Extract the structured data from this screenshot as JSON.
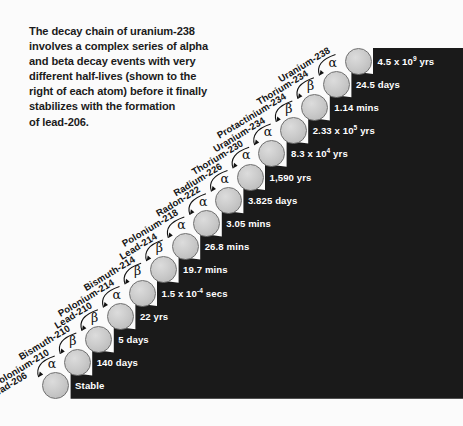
{
  "intro": {
    "text": "The decay chain of uranium-238\ninvolves a complex series of alpha\nand beta decay events with very\ndifferent half-lives (shown to the\nright of each atom) before it finally\nstabilizes with the formation\nof lead-206."
  },
  "colors": {
    "background": "#fbfbfb",
    "panel": "#1a1a1a",
    "atom_fill": "#cacaca",
    "atom_stroke": "#6f6f6f",
    "label_text": "#ffffff",
    "isotope_text": "#141414"
  },
  "chart_data": {
    "type": "diagram",
    "steps": [
      {
        "isotope": "Uranium-238",
        "halflife": "4.5 x 10",
        "exp": "9",
        "unit": " yrs",
        "decay": "α"
      },
      {
        "isotope": "Thorium-234",
        "halflife": "24.5 days",
        "exp": "",
        "unit": "",
        "decay": "β"
      },
      {
        "isotope": "Protactinium-234",
        "halflife": "1.14 mins",
        "exp": "",
        "unit": "",
        "decay": "β"
      },
      {
        "isotope": "Uranium-234",
        "halflife": "2.33 x 10",
        "exp": "5",
        "unit": " yrs",
        "decay": "α"
      },
      {
        "isotope": "Thorium-230",
        "halflife": "8.3 x 10",
        "exp": "4",
        "unit": " yrs",
        "decay": "α"
      },
      {
        "isotope": "Radium-226",
        "halflife": "1,590 yrs",
        "exp": "",
        "unit": "",
        "decay": "α"
      },
      {
        "isotope": "Radon-222",
        "halflife": "3.825 days",
        "exp": "",
        "unit": "",
        "decay": "α"
      },
      {
        "isotope": "Polonium-218",
        "halflife": "3.05 mins",
        "exp": "",
        "unit": "",
        "decay": "α"
      },
      {
        "isotope": "Lead-214",
        "halflife": "26.8 mins",
        "exp": "",
        "unit": "",
        "decay": "β"
      },
      {
        "isotope": "Bismuth-214",
        "halflife": "19.7 mins",
        "exp": "",
        "unit": "",
        "decay": "β"
      },
      {
        "isotope": "Polonium-214",
        "halflife": "1.5 x 10",
        "exp": "-4",
        "unit": " secs",
        "decay": "α"
      },
      {
        "isotope": "Lead-210",
        "halflife": "22 yrs",
        "exp": "",
        "unit": "",
        "decay": "β"
      },
      {
        "isotope": "Bismuth-210",
        "halflife": "5 days",
        "exp": "",
        "unit": "",
        "decay": "β"
      },
      {
        "isotope": "Polonium-210",
        "halflife": "140 days",
        "exp": "",
        "unit": "",
        "decay": "α"
      },
      {
        "isotope": "Lead-206",
        "halflife": "Stable",
        "exp": "",
        "unit": "",
        "decay": ""
      }
    ]
  }
}
